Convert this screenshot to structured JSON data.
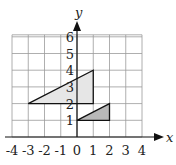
{
  "chart_data": {
    "type": "scatter",
    "title": "",
    "xlabel": "x",
    "ylabel": "y",
    "xlim": [
      -4,
      4
    ],
    "ylim": [
      0,
      6
    ],
    "grid": true,
    "x_ticks": [
      "-4",
      "-3",
      "-2",
      "-1",
      "0",
      "1",
      "2",
      "3",
      "4"
    ],
    "y_ticks": [
      "1",
      "2",
      "3",
      "4",
      "5",
      "6"
    ],
    "shapes": [
      {
        "name": "large-triangle",
        "kind": "triangle",
        "vertices": [
          [
            -3,
            2
          ],
          [
            1,
            2
          ],
          [
            1,
            4
          ]
        ],
        "fill": "#e6e6e6"
      },
      {
        "name": "small-triangle",
        "kind": "triangle",
        "vertices": [
          [
            0,
            1
          ],
          [
            2,
            1
          ],
          [
            2,
            2
          ]
        ],
        "fill": "#b8b8b8"
      }
    ]
  },
  "labels": {
    "x_axis": "x",
    "y_axis": "y"
  }
}
